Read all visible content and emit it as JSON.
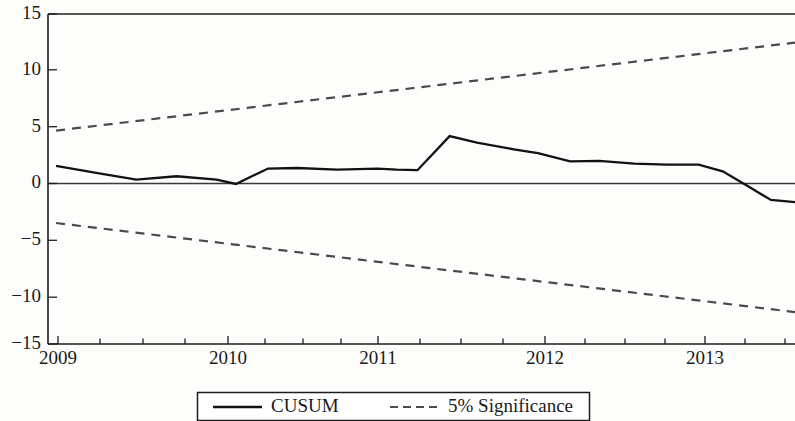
{
  "chart_data": {
    "type": "line",
    "title": "",
    "subtitle": "",
    "xlabel": "",
    "ylabel": "",
    "xlim": [
      2008.95,
      2013.6
    ],
    "ylim": [
      -15,
      15
    ],
    "grid": false,
    "legend_position": "bottom-center",
    "y_ticks": [
      15,
      10,
      5,
      0,
      -5,
      -10,
      -15
    ],
    "y_tick_labels": [
      "15",
      "10",
      "5",
      "0",
      "−5",
      "−10",
      "−15"
    ],
    "x_ticks": [
      2009,
      2010,
      2011,
      2012,
      2013
    ],
    "x_tick_labels": [
      "2009",
      "2010",
      "2011",
      "2012",
      "2013"
    ],
    "x_minor_tick_count_per_year": 4,
    "zero_reference_line": 0,
    "series": [
      {
        "name": "CUSUM",
        "style": "solid",
        "color": "#121212",
        "x": [
          2009.0,
          2009.25,
          2009.5,
          2009.75,
          2010.0,
          2010.12,
          2010.32,
          2010.5,
          2010.75,
          2011.0,
          2011.12,
          2011.25,
          2011.45,
          2011.62,
          2011.85,
          2012.0,
          2012.2,
          2012.38,
          2012.6,
          2012.8,
          2013.0,
          2013.15,
          2013.3,
          2013.45,
          2013.6
        ],
        "y": [
          1.2,
          0.55,
          -0.05,
          0.25,
          -0.05,
          -0.45,
          0.95,
          1.0,
          0.85,
          0.95,
          0.85,
          0.8,
          3.9,
          3.3,
          2.7,
          2.35,
          1.6,
          1.65,
          1.4,
          1.3,
          1.3,
          0.7,
          -0.6,
          -1.9,
          -2.1
        ]
      },
      {
        "name": "5% Significance",
        "style": "dashed",
        "color": "#4a4a4a",
        "x": [
          2009.0,
          2013.6
        ],
        "y": [
          4.4,
          12.4
        ]
      },
      {
        "name": "5% Significance",
        "style": "dashed",
        "color": "#4a4a4a",
        "x": [
          2009.0,
          2013.6
        ],
        "y": [
          -4.0,
          -12.1
        ]
      }
    ]
  },
  "legend": {
    "entries": [
      {
        "label": "CUSUM",
        "style": "solid"
      },
      {
        "label": "5% Significance",
        "style": "dashed"
      }
    ]
  },
  "colors": {
    "cusum": "#121212",
    "significance": "#4a4a4a",
    "axis": "#1c1c1c",
    "background": "#fdfdfc"
  }
}
